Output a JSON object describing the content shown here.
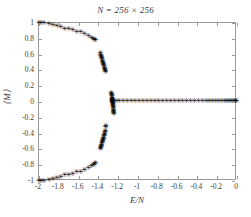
{
  "figure": {
    "title": "N = 256 × 256",
    "xlabel": "E/N",
    "ylabel": "⟨M⟩",
    "marker_glyph": "✳"
  },
  "chart_data": {
    "type": "scatter",
    "title": "N = 256 × 256",
    "xlabel": "E/N",
    "ylabel": "⟨M⟩",
    "xlim": [
      -2,
      0
    ],
    "ylim": [
      -1,
      1
    ],
    "xticks": [
      -2,
      -1.8,
      -1.6,
      -1.4,
      -1.2,
      -1,
      -0.8,
      -0.6,
      -0.4,
      -0.2,
      0
    ],
    "xticklabels": [
      "-2",
      "-1.8",
      "-1.6",
      "-1.4",
      "-1.2",
      "-1",
      "-0.8",
      "-0.6",
      "-0.4",
      "-0.2",
      "0"
    ],
    "yticks": [
      1,
      0.8,
      0.6,
      0.4,
      0.2,
      0,
      -0.2,
      -0.4,
      -0.6,
      -0.8,
      -1
    ],
    "yticklabels": [
      "1",
      "0.8",
      "0.6",
      "0.4",
      "0.2",
      "0",
      "-0.2",
      "-0.4",
      "-0.6",
      "-0.8",
      "-1"
    ],
    "grid": false,
    "legend": null,
    "marker": "star",
    "color": "#000000",
    "series": [
      {
        "name": "upper-branch",
        "points": [
          [
            -2.0,
            1.0
          ],
          [
            -1.98,
            1.0
          ],
          [
            -1.95,
            0.995
          ],
          [
            -1.9,
            0.985
          ],
          [
            -1.86,
            0.975
          ],
          [
            -1.82,
            0.965
          ],
          [
            -1.78,
            0.945
          ],
          [
            -1.74,
            0.93
          ],
          [
            -1.7,
            0.925
          ],
          [
            -1.66,
            0.91
          ],
          [
            -1.62,
            0.89
          ],
          [
            -1.58,
            0.885
          ],
          [
            -1.54,
            0.86
          ],
          [
            -1.5,
            0.83
          ],
          [
            -1.47,
            0.81
          ],
          [
            -1.45,
            0.8
          ],
          [
            -1.44,
            0.79
          ],
          [
            -1.43,
            0.785
          ],
          [
            -1.38,
            0.62
          ],
          [
            -1.38,
            0.6
          ],
          [
            -1.375,
            0.585
          ],
          [
            -1.37,
            0.57
          ],
          [
            -1.37,
            0.555
          ],
          [
            -1.365,
            0.54
          ],
          [
            -1.36,
            0.525
          ],
          [
            -1.36,
            0.51
          ],
          [
            -1.355,
            0.495
          ],
          [
            -1.35,
            0.48
          ],
          [
            -1.35,
            0.465
          ],
          [
            -1.345,
            0.45
          ],
          [
            -1.34,
            0.435
          ],
          [
            -1.34,
            0.42
          ],
          [
            -1.335,
            0.405
          ],
          [
            -1.33,
            0.39
          ],
          [
            -1.33,
            0.375
          ]
        ]
      },
      {
        "name": "lower-branch",
        "points": [
          [
            -2.0,
            -1.0
          ],
          [
            -1.98,
            -1.0
          ],
          [
            -1.95,
            -0.995
          ],
          [
            -1.9,
            -0.985
          ],
          [
            -1.86,
            -0.975
          ],
          [
            -1.82,
            -0.965
          ],
          [
            -1.78,
            -0.945
          ],
          [
            -1.74,
            -0.93
          ],
          [
            -1.7,
            -0.925
          ],
          [
            -1.66,
            -0.91
          ],
          [
            -1.62,
            -0.89
          ],
          [
            -1.58,
            -0.885
          ],
          [
            -1.54,
            -0.86
          ],
          [
            -1.5,
            -0.83
          ],
          [
            -1.47,
            -0.81
          ],
          [
            -1.45,
            -0.8
          ],
          [
            -1.44,
            -0.785
          ],
          [
            -1.43,
            -0.775
          ],
          [
            -1.38,
            -0.6
          ],
          [
            -1.38,
            -0.585
          ],
          [
            -1.375,
            -0.57
          ],
          [
            -1.37,
            -0.555
          ],
          [
            -1.37,
            -0.54
          ],
          [
            -1.365,
            -0.525
          ],
          [
            -1.36,
            -0.51
          ],
          [
            -1.36,
            -0.495
          ],
          [
            -1.355,
            -0.48
          ],
          [
            -1.35,
            -0.465
          ],
          [
            -1.35,
            -0.45
          ],
          [
            -1.345,
            -0.435
          ],
          [
            -1.34,
            -0.42
          ],
          [
            -1.34,
            -0.4
          ],
          [
            -1.335,
            -0.385
          ],
          [
            -1.33,
            -0.37
          ],
          [
            -1.33,
            -0.32
          ],
          [
            -1.325,
            -0.3
          ]
        ]
      },
      {
        "name": "critical-cluster",
        "points": [
          [
            -1.27,
            0.12
          ],
          [
            -1.268,
            0.1
          ],
          [
            -1.266,
            0.085
          ],
          [
            -1.264,
            0.07
          ],
          [
            -1.262,
            0.055
          ],
          [
            -1.26,
            0.04
          ],
          [
            -1.259,
            0.03
          ],
          [
            -1.258,
            0.02
          ],
          [
            -1.257,
            0.01
          ],
          [
            -1.256,
            0.0
          ],
          [
            -1.255,
            -0.01
          ],
          [
            -1.254,
            -0.02
          ],
          [
            -1.253,
            -0.035
          ],
          [
            -1.252,
            -0.05
          ],
          [
            -1.251,
            -0.065
          ],
          [
            -1.25,
            -0.08
          ],
          [
            -1.249,
            -0.095
          ],
          [
            -1.248,
            -0.11
          ],
          [
            -1.247,
            -0.125
          ],
          [
            -1.246,
            -0.14
          ],
          [
            -1.245,
            -0.155
          ],
          [
            -1.26,
            0.0
          ],
          [
            -1.262,
            0.015
          ],
          [
            -1.258,
            -0.015
          ],
          [
            -1.264,
            0.03
          ]
        ]
      },
      {
        "name": "disordered-branch",
        "points": [
          [
            -1.22,
            0.012
          ],
          [
            -1.19,
            0.015
          ],
          [
            -1.15,
            0.012
          ],
          [
            -1.11,
            0.014
          ],
          [
            -1.07,
            0.011
          ],
          [
            -1.03,
            0.013
          ],
          [
            -0.99,
            0.012
          ],
          [
            -0.95,
            0.014
          ],
          [
            -0.91,
            0.011
          ],
          [
            -0.87,
            0.013
          ],
          [
            -0.83,
            0.012
          ],
          [
            -0.79,
            0.013
          ],
          [
            -0.75,
            0.011
          ],
          [
            -0.71,
            0.012
          ],
          [
            -0.67,
            0.013
          ],
          [
            -0.63,
            0.011
          ],
          [
            -0.59,
            0.012
          ],
          [
            -0.55,
            0.013
          ],
          [
            -0.51,
            0.012
          ],
          [
            -0.47,
            0.011
          ],
          [
            -0.43,
            0.012
          ],
          [
            -0.39,
            0.013
          ],
          [
            -0.35,
            0.012
          ],
          [
            -0.31,
            0.011
          ],
          [
            -0.28,
            0.012
          ],
          [
            -0.25,
            0.013
          ],
          [
            -0.22,
            0.012
          ],
          [
            -0.19,
            0.011
          ],
          [
            -0.16,
            0.012
          ],
          [
            -0.13,
            0.013
          ],
          [
            -0.11,
            0.012
          ],
          [
            -0.09,
            0.011
          ],
          [
            -0.07,
            0.012
          ],
          [
            -0.05,
            0.013
          ],
          [
            -0.03,
            0.012
          ],
          [
            -0.015,
            0.012
          ],
          [
            -0.005,
            0.012
          ]
        ]
      }
    ]
  }
}
